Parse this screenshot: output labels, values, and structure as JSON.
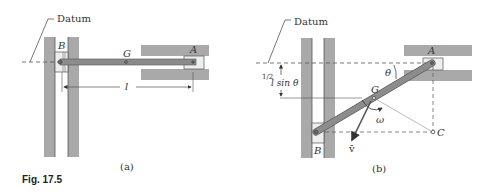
{
  "figure": {
    "caption": "Fig. 17.5",
    "panel_a": {
      "label": "(a)",
      "datum_label": "Datum",
      "point_b": "B",
      "point_g": "G",
      "point_a": "A",
      "length_label": "l"
    },
    "panel_b": {
      "label": "(b)",
      "datum_label": "Datum",
      "point_b": "B",
      "point_g": "G",
      "point_a": "A",
      "point_c": "C",
      "angle_label": "θ",
      "height_label_frac": "1/2",
      "height_label_rest": "l sin θ",
      "omega_label": "ω",
      "velocity_label": "v̄"
    },
    "colors": {
      "wall": "#a9a9a9",
      "rod": "#8c8c8c",
      "line": "#555555"
    }
  }
}
